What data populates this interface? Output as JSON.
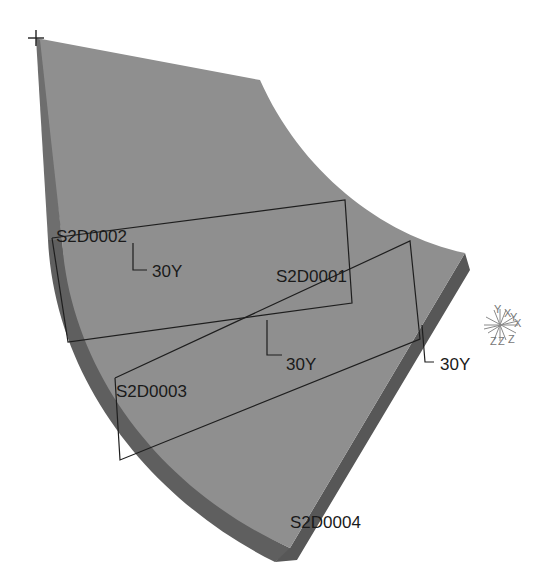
{
  "viewport": {
    "background": "#ffffff",
    "part": {
      "top_face_color": "#8e8e8e",
      "side_face_color": "#5e5e5e",
      "edge_dark_color": "#4a4a4a",
      "line_color": "#1e1e1e"
    }
  },
  "plies": [
    {
      "id": "S2D0001",
      "label": "S2D0001",
      "orientation": "30Y"
    },
    {
      "id": "S2D0002",
      "label": "S2D0002",
      "orientation": "30Y"
    },
    {
      "id": "S2D0003",
      "label": "S2D0003",
      "orientation": "30Y"
    },
    {
      "id": "S2D0004",
      "label": "S2D0004",
      "orientation": "30Y"
    }
  ],
  "triad": {
    "labels": [
      "Y",
      "X",
      "Y",
      "X",
      "Z",
      "Z",
      "Z"
    ]
  }
}
